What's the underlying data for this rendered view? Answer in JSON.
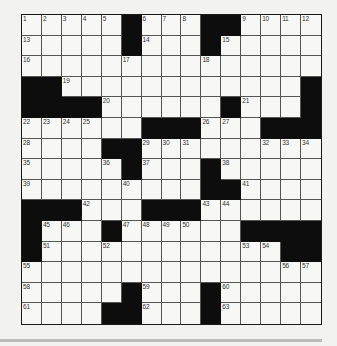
{
  "puzzle": {
    "rows": 15,
    "cols": 15,
    "grid": [
      [
        "1",
        "2",
        "3",
        "4",
        "5",
        "#",
        "6",
        "7",
        "8",
        "#",
        "#",
        "9",
        "10",
        "11",
        "12"
      ],
      [
        "13",
        ".",
        ".",
        ".",
        ".",
        "#",
        "14",
        ".",
        ".",
        "#",
        "15",
        ".",
        ".",
        ".",
        "."
      ],
      [
        "16",
        ".",
        ".",
        ".",
        ".",
        "17",
        ".",
        ".",
        ".",
        "18",
        ".",
        ".",
        ".",
        ".",
        "."
      ],
      [
        "#",
        "#",
        "19",
        ".",
        ".",
        ".",
        ".",
        ".",
        ".",
        ".",
        ".",
        ".",
        ".",
        ".",
        "#"
      ],
      [
        "#",
        "#",
        "#",
        "#",
        "20",
        ".",
        ".",
        ".",
        ".",
        ".",
        "#",
        "21",
        ".",
        ".",
        "#"
      ],
      [
        "22",
        "23",
        "24",
        "25",
        ".",
        ".",
        "#",
        "#",
        "#",
        "26",
        "27",
        ".",
        "#",
        "#",
        "#"
      ],
      [
        "28",
        ".",
        ".",
        ".",
        "#",
        "#",
        "29",
        "30",
        "31",
        ".",
        ".",
        ".",
        "32",
        "33",
        "34"
      ],
      [
        "35",
        ".",
        ".",
        ".",
        "36",
        "#",
        "37",
        ".",
        ".",
        "#",
        "38",
        ".",
        ".",
        ".",
        "."
      ],
      [
        "39",
        ".",
        ".",
        ".",
        ".",
        "40",
        ".",
        ".",
        ".",
        "#",
        "#",
        "41",
        ".",
        ".",
        "."
      ],
      [
        "#",
        "#",
        "#",
        "42",
        ".",
        ".",
        "#",
        "#",
        "#",
        "43",
        "44",
        ".",
        ".",
        ".",
        "."
      ],
      [
        "#",
        "45",
        "46",
        ".",
        "#",
        "47",
        "48",
        "49",
        "50",
        ".",
        ".",
        "#",
        "#",
        "#",
        "#"
      ],
      [
        "#",
        "51",
        ".",
        ".",
        "52",
        ".",
        ".",
        ".",
        ".",
        ".",
        ".",
        "53",
        "54",
        "#",
        "#"
      ],
      [
        "55",
        ".",
        ".",
        ".",
        ".",
        ".",
        ".",
        ".",
        ".",
        ".",
        ".",
        ".",
        ".",
        "56",
        "57"
      ],
      [
        "58",
        ".",
        ".",
        ".",
        ".",
        "#",
        "59",
        ".",
        ".",
        "#",
        "60",
        ".",
        ".",
        ".",
        "."
      ],
      [
        "61",
        ".",
        ".",
        ".",
        "#",
        "#",
        "62",
        ".",
        ".",
        "#",
        "63",
        ".",
        ".",
        ".",
        "."
      ]
    ],
    "legend": {
      "#": "black-square",
      ".": "empty-white-square",
      "number": "numbered-white-square"
    }
  },
  "colors": {
    "background": "#f2f2f0",
    "cell": "#f7f7f5",
    "black_square": "#0d0d0d",
    "grid_line": "#555555",
    "rule_line": "#bcbcbc"
  }
}
